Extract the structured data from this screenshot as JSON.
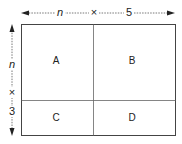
{
  "diagram": {
    "width_label": {
      "factor_1": "n",
      "operator": "×",
      "factor_2": "5"
    },
    "height_label": {
      "factor_1": "n",
      "operator": "×",
      "factor_2": "3"
    },
    "cells": [
      {
        "id": "A",
        "label": "A"
      },
      {
        "id": "B",
        "label": "B"
      },
      {
        "id": "C",
        "label": "C"
      },
      {
        "id": "D",
        "label": "D"
      }
    ],
    "colors": {
      "line": "#444444",
      "divider": "#666666",
      "text": "#222222",
      "dashed": "#555555"
    }
  }
}
